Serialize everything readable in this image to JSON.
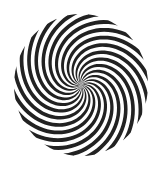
{
  "image": {
    "subject": "spiral optical illusion",
    "background": "#ffffff",
    "stripe_color": "#222222",
    "center": [
      81,
      85
    ],
    "radius_x": 67,
    "radius_y": 71,
    "arm_count": 20,
    "twist_degrees": 150,
    "direction": "clockwise"
  }
}
